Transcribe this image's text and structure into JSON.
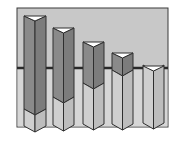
{
  "diagram": {
    "title": "",
    "colors": {
      "background": "#ffffff",
      "panel": "#c8c8c8",
      "panel_border": "#3a3a3a",
      "reference_line": "#2a2a2a",
      "upper_face_left": "#8a8a8a",
      "upper_face_right": "#7c7c7c",
      "lower_face_left": "#cfcfcf",
      "lower_face_right": "#bdbdbd",
      "cap": "#ffffff",
      "outline": "#2e2e2e"
    },
    "panel": {
      "x": 17,
      "y": 8,
      "w": 151,
      "h": 119
    },
    "reference_line_y": 68,
    "bars": [
      {
        "x": 24,
        "w": 22,
        "top": 16,
        "split": 115,
        "bottom": 132
      },
      {
        "x": 53,
        "w": 21,
        "top": 28,
        "split": 103,
        "bottom": 131
      },
      {
        "x": 83,
        "w": 21,
        "top": 42,
        "split": 89,
        "bottom": 130
      },
      {
        "x": 112,
        "w": 21,
        "top": 53,
        "split": 76,
        "bottom": 130
      },
      {
        "x": 143,
        "w": 21,
        "top": 66,
        "split": 66,
        "bottom": 129
      }
    ]
  }
}
